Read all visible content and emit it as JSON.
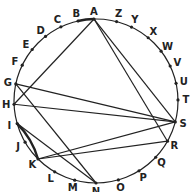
{
  "diagram": {
    "type": "circle-letter-graph",
    "circle": {
      "cx": 96,
      "cy": 101,
      "r": 82
    },
    "letters": [
      {
        "id": "A",
        "x": 94,
        "y": 18,
        "lx": 94,
        "ly": 13
      },
      {
        "id": "Z",
        "x": 117,
        "y": 20,
        "lx": 117,
        "ly": 15
      },
      {
        "id": "Y",
        "x": 132,
        "y": 26,
        "lx": 136,
        "ly": 21
      },
      {
        "id": "X",
        "x": 148,
        "y": 38,
        "lx": 153,
        "ly": 33
      },
      {
        "id": "W",
        "x": 160,
        "y": 52,
        "lx": 166,
        "ly": 49
      },
      {
        "id": "V",
        "x": 168,
        "y": 67,
        "lx": 175,
        "ly": 65
      },
      {
        "id": "U",
        "x": 173,
        "y": 84,
        "lx": 180,
        "ly": 86
      },
      {
        "id": "T",
        "x": 174,
        "y": 100,
        "lx": 180,
        "ly": 104
      },
      {
        "id": "S",
        "x": 168,
        "y": 120,
        "lx": 175,
        "ly": 125
      },
      {
        "id": "R",
        "x": 160,
        "y": 137,
        "lx": 166,
        "ly": 143
      },
      {
        "id": "Q",
        "x": 148,
        "y": 150,
        "lx": 153,
        "ly": 158
      },
      {
        "id": "P",
        "x": 133,
        "y": 161,
        "lx": 136,
        "ly": 169
      },
      {
        "id": "O",
        "x": 115,
        "y": 168,
        "lx": 117,
        "ly": 177
      },
      {
        "id": "N",
        "x": 96,
        "y": 172,
        "lx": 96,
        "ly": 182
      },
      {
        "id": "M",
        "x": 78,
        "y": 168,
        "lx": 76,
        "ly": 178
      },
      {
        "id": "L",
        "x": 61,
        "y": 161,
        "lx": 58,
        "ly": 170
      },
      {
        "id": "K",
        "x": 45,
        "y": 152,
        "lx": 40,
        "ly": 159
      },
      {
        "id": "J",
        "x": 34,
        "y": 137,
        "lx": 27,
        "ly": 141
      },
      {
        "id": "I",
        "x": 26,
        "y": 121,
        "lx": 19,
        "ly": 123
      },
      {
        "id": "H",
        "x": 21,
        "y": 104,
        "lx": 12,
        "ly": 104
      },
      {
        "id": "G",
        "x": 21,
        "y": 85,
        "lx": 12,
        "ly": 84
      },
      {
        "id": "F",
        "x": 26,
        "y": 67,
        "lx": 19,
        "ly": 64
      },
      {
        "id": "E",
        "x": 34,
        "y": 51,
        "lx": 29,
        "ly": 46
      },
      {
        "id": "D",
        "x": 46,
        "y": 37,
        "lx": 42,
        "ly": 31
      },
      {
        "id": "C",
        "x": 61,
        "y": 27,
        "lx": 59,
        "ly": 20
      },
      {
        "id": "B",
        "x": 78,
        "y": 21,
        "lx": 77,
        "ly": 14
      }
    ],
    "chords": [
      [
        "A",
        "H"
      ],
      [
        "A",
        "S"
      ],
      [
        "A",
        "R"
      ],
      [
        "G",
        "S"
      ],
      [
        "H",
        "S"
      ],
      [
        "G",
        "N"
      ],
      [
        "I",
        "N"
      ],
      [
        "K",
        "S"
      ],
      [
        "K",
        "R"
      ]
    ],
    "bold_arcs": [
      [
        "I",
        "K"
      ],
      [
        "B",
        "A"
      ]
    ],
    "colors": {
      "stroke": "#222222",
      "text": "#222222",
      "background": "#ffffff"
    }
  }
}
